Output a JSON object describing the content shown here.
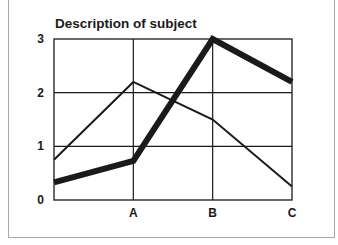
{
  "chart_data": {
    "type": "line",
    "title": "Description of subject",
    "xlabel": "",
    "ylabel": "",
    "x": [
      "",
      "A",
      "B",
      "C"
    ],
    "categories": [
      "",
      "A",
      "B",
      "C"
    ],
    "yticks": [
      "0",
      "1",
      "2",
      "3"
    ],
    "ylim": [
      0,
      3
    ],
    "grid": true,
    "legend": null,
    "series": [
      {
        "name": "thick line",
        "values": [
          0.33,
          0.73,
          3.0,
          2.2
        ],
        "stroke_width": 6
      },
      {
        "name": "thin line",
        "values": [
          0.75,
          2.2,
          1.5,
          0.25
        ],
        "stroke_width": 2
      }
    ]
  },
  "colors": {
    "line": "#1a1a1a",
    "grid": "#1a1a1a",
    "frame": "#a8a8a8"
  }
}
